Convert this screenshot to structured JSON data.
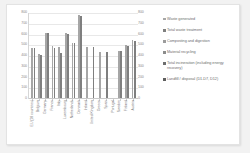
{
  "chart_data": {
    "type": "bar",
    "title": "",
    "xlabel": "",
    "ylabel": "",
    "ylim": [
      0,
      800
    ],
    "ytick_values": [
      800,
      700,
      600,
      500,
      400,
      300,
      200,
      100,
      0
    ],
    "ytick_labels": [
      "800",
      "700",
      "600",
      "500",
      "400",
      "300",
      "200",
      "100",
      "0"
    ],
    "dual_y_axis": true,
    "grid": true,
    "legend_position": "right",
    "categories": [
      "EU (28 countries)",
      "Belgium",
      "Germany",
      "France",
      "Italy",
      "Luxembourg",
      "Netherlands",
      "Denmark",
      "Ireland",
      "United Kingdom",
      "Greece",
      "Spain",
      "Portugal",
      "Sweden",
      "Finland",
      "Austria"
    ],
    "series": [
      {
        "name": "Waste generated",
        "color": "#a6a6a6",
        "values": [
          475,
          420,
          615,
          495,
          485,
          615,
          525,
          780,
          485,
          0,
          440,
          0,
          0,
          450,
          500,
          545
        ]
      },
      {
        "name": "Total waste treatment",
        "color": "#7f7f7f",
        "values": [
          470,
          410,
          610,
          470,
          425,
          605,
          520,
          775,
          0,
          480,
          0,
          440,
          0,
          445,
          495,
          540
        ]
      },
      {
        "name": "Composting and digestion",
        "color": "#9c9c9c",
        "values": [
          0,
          0,
          0,
          0,
          0,
          0,
          0,
          0,
          0,
          0,
          0,
          0,
          0,
          0,
          0,
          0
        ]
      },
      {
        "name": "Material recycling",
        "color": "#8c8c8c",
        "values": [
          0,
          0,
          0,
          0,
          0,
          0,
          0,
          0,
          0,
          0,
          0,
          0,
          0,
          0,
          0,
          0
        ]
      },
      {
        "name": "Total incineration (including energy recovery)",
        "color": "#6e6e6e",
        "values": [
          0,
          0,
          0,
          0,
          0,
          0,
          0,
          0,
          0,
          0,
          0,
          0,
          0,
          0,
          0,
          0
        ]
      },
      {
        "name": "Landfill / disposal (D1-D7, D12)",
        "color": "#5e5e5e",
        "values": [
          0,
          0,
          0,
          0,
          0,
          0,
          0,
          0,
          0,
          0,
          0,
          0,
          0,
          0,
          0,
          0
        ]
      }
    ]
  },
  "legend": {
    "items": [
      {
        "label": "Waste generated",
        "color": "#a6a6a6"
      },
      {
        "label": "Total waste treatment",
        "color": "#7f7f7f"
      },
      {
        "label": "Composting and digestion",
        "color": "#9c9c9c"
      },
      {
        "label": "Material recycling",
        "color": "#8c8c8c"
      },
      {
        "label": "Total incineration (including energy recovery)",
        "color": "#6e6e6e"
      },
      {
        "label": "Landfill / disposal (D1-D7, D12)",
        "color": "#5e5e5e"
      }
    ]
  },
  "style": {
    "plot_background": "#ffffff",
    "grid_color": "#e8e8e8",
    "axis_text_color": "#8a8a8a",
    "frame_background": "#f2f2f2"
  }
}
